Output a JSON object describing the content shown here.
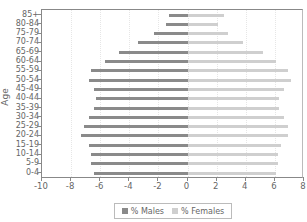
{
  "chart_data": {
    "type": "bar",
    "orientation": "horizontal",
    "subtype": "population-pyramid",
    "title": "",
    "xlabel": "",
    "ylabel": "Age",
    "xlim": [
      -10,
      8
    ],
    "x_ticks": [
      -10,
      -8,
      -6,
      -4,
      -2,
      0,
      2,
      4,
      6,
      8
    ],
    "grid": true,
    "legend_position": "bottom",
    "categories": [
      "85+",
      "80-84",
      "75-79",
      "70-74",
      "65-69",
      "60-64",
      "55-59",
      "50-54",
      "45-49",
      "40-44",
      "35-39",
      "30-34",
      "25-29",
      "20-24",
      "15-19",
      "10-14",
      "5-9",
      "0-4"
    ],
    "series": [
      {
        "name": "% Males",
        "color": "#8a8a8a",
        "values": [
          -1.3,
          -1.5,
          -2.3,
          -3.4,
          -4.7,
          -5.7,
          -6.6,
          -6.8,
          -6.4,
          -6.3,
          -6.4,
          -6.8,
          -7.1,
          -7.3,
          -6.8,
          -6.6,
          -6.6,
          -6.4
        ]
      },
      {
        "name": "% Females",
        "color": "#cfcfcf",
        "values": [
          2.5,
          2.1,
          2.8,
          3.8,
          5.2,
          6.1,
          6.9,
          7.1,
          6.6,
          6.3,
          6.3,
          6.6,
          6.9,
          6.9,
          6.4,
          6.2,
          6.2,
          6.1
        ]
      }
    ]
  },
  "legend": {
    "males_label": "% Males",
    "females_label": "% Females"
  },
  "axis": {
    "y_title": "Age"
  }
}
